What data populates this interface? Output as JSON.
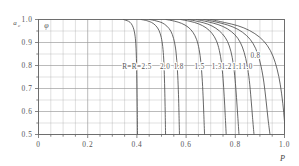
{
  "chart_data": {
    "type": "line",
    "title": "",
    "xlabel": "P",
    "ylabel": "a_c",
    "ylabel_main": "a",
    "ylabel_sub": "c",
    "inner_symbol": "φ",
    "xlim": [
      0,
      1.0
    ],
    "ylim": [
      0.5,
      1.0
    ],
    "grid": true,
    "legend_position": "inline",
    "x_ticks": [
      "0",
      "0.2",
      "0.4",
      "0.6",
      "0.8",
      "1.0"
    ],
    "x_tick_values": [
      0,
      0.2,
      0.4,
      0.6,
      0.8,
      1.0
    ],
    "y_ticks": [
      "0.5",
      "0.6",
      "0.7",
      "0.8",
      "0.9",
      "1.0"
    ],
    "y_tick_values": [
      0.5,
      0.6,
      0.7,
      0.8,
      0.9,
      1.0
    ],
    "x_minor_step": 0.05,
    "y_minor_step": 0.05,
    "series_prefix_label": "R=",
    "series": [
      {
        "name": "2.5",
        "label": "R=2.5",
        "label_x": 0.4,
        "label_y": 0.795,
        "points": [
          [
            0.345,
            1.0
          ],
          [
            0.36,
            0.995
          ],
          [
            0.372,
            0.988
          ],
          [
            0.381,
            0.975
          ],
          [
            0.388,
            0.955
          ],
          [
            0.393,
            0.925
          ],
          [
            0.396,
            0.885
          ],
          [
            0.398,
            0.83
          ],
          [
            0.3995,
            0.76
          ],
          [
            0.4005,
            0.68
          ],
          [
            0.4015,
            0.6
          ],
          [
            0.4025,
            0.5
          ]
        ]
      },
      {
        "name": "2.0",
        "label": "2.0",
        "label_x": 0.515,
        "label_y": 0.795,
        "points": [
          [
            0.417,
            1.0
          ],
          [
            0.44,
            0.995
          ],
          [
            0.46,
            0.987
          ],
          [
            0.477,
            0.973
          ],
          [
            0.49,
            0.952
          ],
          [
            0.499,
            0.922
          ],
          [
            0.505,
            0.882
          ],
          [
            0.509,
            0.828
          ],
          [
            0.5115,
            0.76
          ],
          [
            0.5135,
            0.68
          ],
          [
            0.515,
            0.6
          ],
          [
            0.5165,
            0.5
          ]
        ]
      },
      {
        "name": "1.8",
        "label": "1.8",
        "label_x": 0.57,
        "label_y": 0.795,
        "points": [
          [
            0.452,
            1.0
          ],
          [
            0.478,
            0.994
          ],
          [
            0.502,
            0.986
          ],
          [
            0.522,
            0.971
          ],
          [
            0.538,
            0.949
          ],
          [
            0.549,
            0.918
          ],
          [
            0.557,
            0.876
          ],
          [
            0.562,
            0.822
          ],
          [
            0.566,
            0.755
          ],
          [
            0.569,
            0.675
          ],
          [
            0.571,
            0.595
          ],
          [
            0.573,
            0.5
          ]
        ]
      },
      {
        "name": "1.5",
        "label": "1.5",
        "label_x": 0.655,
        "label_y": 0.795,
        "points": [
          [
            0.518,
            1.0
          ],
          [
            0.552,
            0.993
          ],
          [
            0.582,
            0.983
          ],
          [
            0.608,
            0.967
          ],
          [
            0.628,
            0.944
          ],
          [
            0.643,
            0.912
          ],
          [
            0.653,
            0.87
          ],
          [
            0.66,
            0.815
          ],
          [
            0.665,
            0.748
          ],
          [
            0.669,
            0.668
          ],
          [
            0.672,
            0.588
          ],
          [
            0.675,
            0.5
          ]
        ]
      },
      {
        "name": "1.3",
        "label": "1.3",
        "label_x": 0.725,
        "label_y": 0.795,
        "points": [
          [
            0.578,
            1.0
          ],
          [
            0.616,
            0.992
          ],
          [
            0.651,
            0.981
          ],
          [
            0.681,
            0.964
          ],
          [
            0.705,
            0.94
          ],
          [
            0.723,
            0.908
          ],
          [
            0.735,
            0.866
          ],
          [
            0.744,
            0.811
          ],
          [
            0.75,
            0.744
          ],
          [
            0.755,
            0.664
          ],
          [
            0.759,
            0.584
          ],
          [
            0.763,
            0.5
          ]
        ]
      },
      {
        "name": "1.2",
        "label": "1.2",
        "label_x": 0.765,
        "label_y": 0.795,
        "points": [
          [
            0.608,
            1.0
          ],
          [
            0.65,
            0.991
          ],
          [
            0.688,
            0.98
          ],
          [
            0.721,
            0.962
          ],
          [
            0.748,
            0.937
          ],
          [
            0.768,
            0.905
          ],
          [
            0.782,
            0.862
          ],
          [
            0.792,
            0.806
          ],
          [
            0.799,
            0.74
          ],
          [
            0.805,
            0.66
          ],
          [
            0.81,
            0.58
          ],
          [
            0.815,
            0.5
          ]
        ]
      },
      {
        "name": "1.1",
        "label": "1.1",
        "label_x": 0.808,
        "label_y": 0.795,
        "points": [
          [
            0.642,
            1.0
          ],
          [
            0.688,
            0.99
          ],
          [
            0.73,
            0.978
          ],
          [
            0.767,
            0.96
          ],
          [
            0.798,
            0.934
          ],
          [
            0.82,
            0.901
          ],
          [
            0.836,
            0.857
          ],
          [
            0.848,
            0.801
          ],
          [
            0.857,
            0.735
          ],
          [
            0.864,
            0.655
          ],
          [
            0.87,
            0.575
          ],
          [
            0.876,
            0.5
          ]
        ]
      },
      {
        "name": "1.0",
        "label": "1.0",
        "label_x": 0.85,
        "label_y": 0.795,
        "points": [
          [
            0.672,
            1.0
          ],
          [
            0.722,
            0.989
          ],
          [
            0.769,
            0.976
          ],
          [
            0.811,
            0.957
          ],
          [
            0.846,
            0.93
          ],
          [
            0.872,
            0.896
          ],
          [
            0.891,
            0.851
          ],
          [
            0.905,
            0.795
          ],
          [
            0.916,
            0.728
          ],
          [
            0.925,
            0.648
          ],
          [
            0.933,
            0.568
          ],
          [
            0.941,
            0.5
          ]
        ]
      },
      {
        "name": "0.8",
        "label": "0.8",
        "label_x": 0.882,
        "label_y": 0.845,
        "points": [
          [
            0.7,
            1.0
          ],
          [
            0.756,
            0.987
          ],
          [
            0.81,
            0.973
          ],
          [
            0.858,
            0.952
          ],
          [
            0.899,
            0.923
          ],
          [
            0.93,
            0.887
          ],
          [
            0.953,
            0.841
          ],
          [
            0.97,
            0.784
          ],
          [
            0.983,
            0.716
          ],
          [
            0.993,
            0.636
          ],
          [
            1.0,
            0.556
          ],
          [
            1.004,
            0.5
          ]
        ]
      }
    ]
  },
  "axes": {
    "x_title": "P",
    "y_title_main": "a",
    "y_title_sub": "c",
    "inner_symbol": "φ"
  },
  "colors": {
    "background": "#ffffff",
    "grid": "#9a9a9a",
    "axis": "#666666",
    "curve": "#4d4d4d",
    "text": "#555555"
  }
}
